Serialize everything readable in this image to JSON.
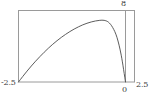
{
  "chart_data": {
    "type": "line",
    "title": "",
    "xlabel": "",
    "ylabel": "",
    "xlim": [
      -2.5,
      2.5
    ],
    "ylim": [
      0,
      8
    ],
    "grid": false,
    "legend": null,
    "frame": true,
    "axis_labels": {
      "y_max": "8",
      "x_min": "-2.5",
      "x_zero": "0",
      "x_max": "2.5"
    },
    "tick_labels": {
      "x": [
        "-2.5",
        "0",
        "2.5"
      ],
      "y": [
        "8"
      ]
    },
    "series": [
      {
        "name": "curve",
        "color": "#4a4a4a",
        "x": [
          -2.5,
          -2.4,
          -2.3,
          -2.2,
          -2.1,
          -2.0,
          -1.9,
          -1.8,
          -1.7,
          -1.6,
          -1.5,
          -1.4,
          -1.3,
          -1.2,
          -1.1,
          -1.0,
          -0.9,
          -0.8,
          -0.7,
          -0.6,
          -0.5,
          -0.4,
          -0.3,
          -0.2,
          -0.1,
          0.0
        ],
        "y": [
          0.0,
          0.62,
          1.22,
          1.79,
          2.33,
          2.84,
          3.33,
          3.79,
          4.22,
          4.62,
          4.99,
          5.33,
          5.64,
          5.92,
          6.17,
          6.39,
          6.57,
          6.72,
          6.83,
          6.9,
          6.9,
          6.7,
          6.1,
          5.0,
          3.0,
          0.0
        ]
      }
    ],
    "peak": {
      "x": -0.55,
      "y": 6.92
    },
    "endpoints": [
      {
        "x": -2.5,
        "y": 0.0
      },
      {
        "x": 0.0,
        "y": 0.0
      }
    ]
  },
  "style": {
    "frame_color": "#9a9a9a",
    "curve_color": "#4a4a4a",
    "background": "#ffffff",
    "text_color": "#3a3a3a"
  }
}
